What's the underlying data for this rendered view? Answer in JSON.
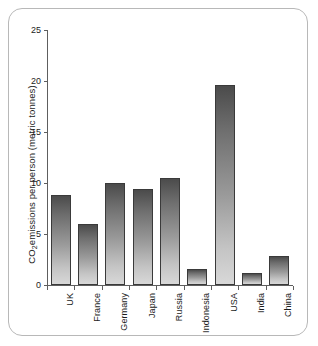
{
  "chart_data": {
    "type": "bar",
    "title": "",
    "subtitle": "",
    "xlabel": "",
    "ylabel": "CO2 emissions per person  (metric tonnes)",
    "ylabel_main": "emissions per person  (metric tonnes)",
    "ylabel_prefix": "CO",
    "ylabel_sub": "2",
    "ylim": [
      0,
      25
    ],
    "yticks": [
      0,
      5,
      10,
      15,
      20,
      25
    ],
    "ytick_labels": [
      "0",
      "5",
      "10",
      "15",
      "20",
      "25"
    ],
    "grid": false,
    "legend": false,
    "legend_position": "none",
    "categories": [
      "UK",
      "France",
      "Germany",
      "Japan",
      "Russia",
      "Indonesia",
      "USA",
      "India",
      "China"
    ],
    "values": [
      8.8,
      6.0,
      10.0,
      9.4,
      10.5,
      1.6,
      19.6,
      1.2,
      2.8
    ],
    "bar_color_top": "#4b4b4b",
    "bar_color_bottom": "#d8d8d8",
    "bar_border_color": "#3a3a3a",
    "axis_color": "#5e5e5e",
    "frame_color": "#b8b8b8",
    "background": "#ffffff"
  }
}
